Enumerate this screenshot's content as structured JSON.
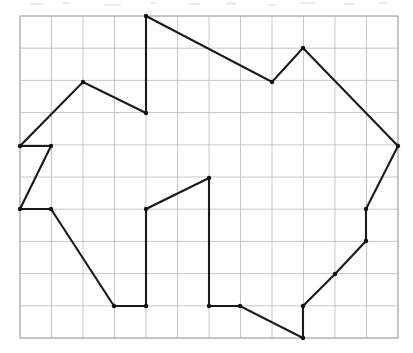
{
  "figure": {
    "type": "line-drawing",
    "canvas": {
      "width": 413,
      "height": 353,
      "background": "#ffffff"
    },
    "grid": {
      "visible": true,
      "origin_x": 20,
      "origin_y": 16,
      "cell_width": 31.5,
      "cell_height": 32.2,
      "columns": 12,
      "rows": 10,
      "line_color": "#b9b9b9",
      "line_width": 0.8,
      "border_color": "#b0b0b0"
    },
    "polygon": {
      "closed": true,
      "stroke_color": "#1a1a1a",
      "stroke_width": 2.1,
      "fill": "none",
      "vertex_marker": "round-dot",
      "vertex_marker_color": "#111111",
      "vertex_marker_radius": 2.2,
      "vertex_count": 24,
      "grid_vertices": [
        [
          4,
          0
        ],
        [
          8,
          2
        ],
        [
          9,
          1
        ],
        [
          12,
          4
        ],
        [
          11,
          6
        ],
        [
          11,
          7
        ],
        [
          10,
          8
        ],
        [
          9,
          9
        ],
        [
          9,
          10
        ],
        [
          7,
          9
        ],
        [
          6,
          9
        ],
        [
          6,
          5
        ],
        [
          4,
          6
        ],
        [
          4,
          9
        ],
        [
          3,
          9
        ],
        [
          1,
          6
        ],
        [
          0,
          6
        ],
        [
          1,
          4
        ],
        [
          0,
          4
        ],
        [
          2,
          2
        ],
        [
          4,
          3
        ],
        [
          4,
          0
        ]
      ],
      "pixel_vertices": [
        [
          146,
          16
        ],
        [
          272,
          82
        ],
        [
          303,
          48
        ],
        [
          398,
          146
        ],
        [
          366,
          209
        ],
        [
          366,
          241
        ],
        [
          335,
          274
        ],
        [
          303,
          306
        ],
        [
          303,
          338
        ],
        [
          240,
          306
        ],
        [
          209,
          306
        ],
        [
          209,
          178
        ],
        [
          146,
          209
        ],
        [
          146,
          306
        ],
        [
          114,
          306
        ],
        [
          51,
          209
        ],
        [
          20,
          209
        ],
        [
          51,
          146
        ],
        [
          20,
          146
        ],
        [
          83,
          82
        ],
        [
          146,
          113
        ]
      ]
    },
    "labels": {
      "axis_labels": [],
      "tick_labels": [],
      "annotations": [],
      "legend": []
    }
  }
}
